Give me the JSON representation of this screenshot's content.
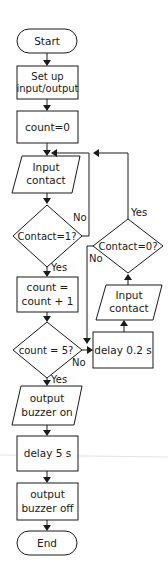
{
  "flowchart": {
    "start": "Start",
    "setup": [
      "Set up",
      "input/output"
    ],
    "init": "count=0",
    "input1": [
      "Input",
      "contact"
    ],
    "decision1": "Contact=1?",
    "decision1_yes": "Yes",
    "decision1_no": "No",
    "increment": [
      "count =",
      "count + 1"
    ],
    "decision2": "count = 5?",
    "decision2_yes": "Yes",
    "decision2_no": "No",
    "delay_short": "delay 0.2 s",
    "input2": [
      "Input",
      "contact"
    ],
    "decision3": "Contact=0?",
    "decision3_yes": "Yes",
    "decision3_no": "No",
    "buzzer_on": [
      "output",
      "buzzer on"
    ],
    "delay_long": "delay 5 s",
    "buzzer_off": [
      "output",
      "buzzer off"
    ],
    "end": "End"
  },
  "colors": {
    "stroke": "#1a1a1a",
    "background": "#ffffff"
  }
}
